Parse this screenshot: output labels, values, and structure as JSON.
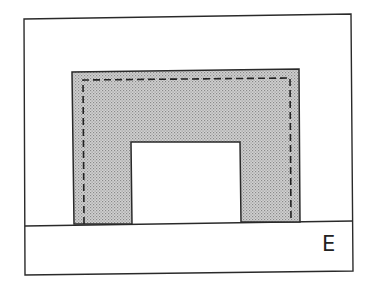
{
  "diagram": {
    "type": "cross-section schematic",
    "outer_frame": {
      "points": [
        [
          24,
          19
        ],
        [
          351,
          14
        ],
        [
          353,
          271
        ],
        [
          25,
          275
        ]
      ],
      "stroke": "#2a2a2a"
    },
    "base_layer": {
      "label": "E",
      "top_line": [
        [
          25,
          226
        ],
        [
          353,
          221
        ]
      ],
      "fill": "#ffffff"
    },
    "shaded_layer": {
      "fill": "#c4c4c4",
      "stroke": "#2a2a2a",
      "pattern": "halftone stipple",
      "outer_outline": [
        [
          74,
          224
        ],
        [
          72,
          72
        ],
        [
          299,
          69
        ],
        [
          300,
          222
        ]
      ],
      "inner_cutout": [
        [
          132,
          224
        ],
        [
          131,
          142
        ],
        [
          240,
          142
        ],
        [
          241,
          222
        ]
      ],
      "dashed_line": {
        "points": [
          [
            84,
            224
          ],
          [
            83,
            80
          ],
          [
            290,
            78
          ],
          [
            291,
            222
          ]
        ],
        "stroke": "#222222",
        "dash": "7 4"
      }
    },
    "labels": [
      {
        "id": "base",
        "text": "E"
      }
    ]
  }
}
